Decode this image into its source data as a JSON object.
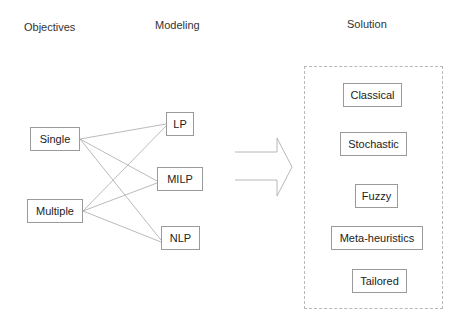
{
  "headers": {
    "objectives": "Objectives",
    "modeling": "Modeling",
    "solution": "Solution"
  },
  "objectives": [
    {
      "id": "single",
      "label": "Single"
    },
    {
      "id": "multiple",
      "label": "Multiple"
    }
  ],
  "models": [
    {
      "id": "lp",
      "label": "LP"
    },
    {
      "id": "milp",
      "label": "MILP"
    },
    {
      "id": "nlp",
      "label": "NLP"
    }
  ],
  "solutions": [
    {
      "id": "classical",
      "label": "Classical"
    },
    {
      "id": "stochastic",
      "label": "Stochastic"
    },
    {
      "id": "fuzzy",
      "label": "Fuzzy"
    },
    {
      "id": "meta-heuristics",
      "label": "Meta-heuristics"
    },
    {
      "id": "tailored",
      "label": "Tailored"
    }
  ],
  "edges": [
    {
      "from": "Single",
      "to": "LP"
    },
    {
      "from": "Single",
      "to": "MILP"
    },
    {
      "from": "Single",
      "to": "NLP"
    },
    {
      "from": "Multiple",
      "to": "LP"
    },
    {
      "from": "Multiple",
      "to": "MILP"
    },
    {
      "from": "Multiple",
      "to": "NLP"
    }
  ],
  "arrow": {
    "from": "Modeling",
    "to": "Solution",
    "icon": "right-block-arrow-icon"
  },
  "colors": {
    "box_border": "#9a9a9a",
    "edge_line": "#a8a8a8",
    "frame_border": "#b8b8b8",
    "text": "#222222"
  }
}
